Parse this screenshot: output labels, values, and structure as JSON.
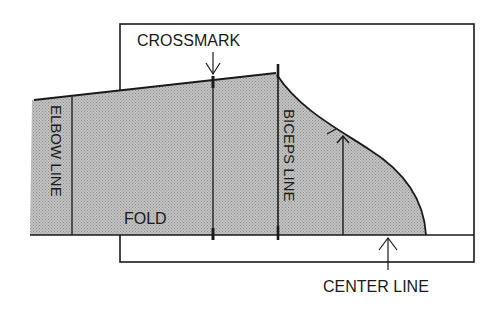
{
  "diagram": {
    "type": "sewing-pattern-sleeve-layout",
    "labels": {
      "crossmark": "CROSSMARK",
      "elbow_line": "ELBOW LINE",
      "biceps_line": "BICEPS LINE",
      "fold": "FOLD",
      "center_line": "CENTER LINE"
    },
    "colors": {
      "stroke": "#1a1a1a",
      "pattern_fill": "#b8b8b8",
      "paper": "#ffffff"
    }
  }
}
